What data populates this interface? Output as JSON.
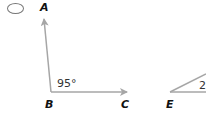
{
  "option": {
    "name": "answer-option-radio",
    "selected": false
  },
  "figure_left": {
    "points": {
      "A": "A",
      "B": "B",
      "C": "C"
    },
    "angle_label": "95°",
    "stroke_color": "#a6a6a6"
  },
  "figure_right": {
    "points": {
      "E": "E"
    },
    "angle_label_partial": "2",
    "stroke_color": "#a6a6a6"
  }
}
